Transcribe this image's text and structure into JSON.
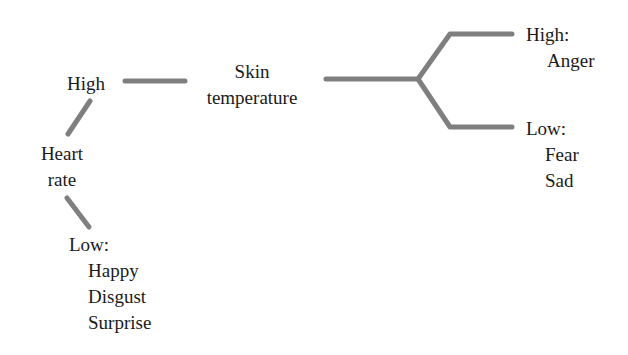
{
  "diagram": {
    "type": "decision-tree",
    "line_color": "#7f7f7f",
    "nodes": {
      "heart_rate": {
        "line1": "Heart",
        "line2": "rate"
      },
      "heart_high": {
        "label": "High"
      },
      "heart_low": {
        "label": "Low:",
        "items": [
          "Happy",
          "Disgust",
          "Surprise"
        ]
      },
      "skin_temp": {
        "line1": "Skin",
        "line2": "temperature"
      },
      "skin_high": {
        "label": "High:",
        "items": [
          "Anger"
        ]
      },
      "skin_low": {
        "label": "Low:",
        "items": [
          "Fear",
          "Sad"
        ]
      }
    }
  }
}
